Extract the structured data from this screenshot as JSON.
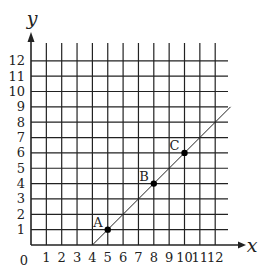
{
  "figure": {
    "origin_label": "0",
    "x_axis_label": "x",
    "y_axis_label": "y",
    "x_ticks": [
      "1",
      "2",
      "3",
      "4",
      "5",
      "6",
      "7",
      "8",
      "9",
      "10",
      "11",
      "12"
    ],
    "y_ticks": [
      "1",
      "2",
      "3",
      "4",
      "5",
      "6",
      "7",
      "8",
      "9",
      "10",
      "11",
      "12"
    ],
    "points": [
      {
        "label": "A",
        "x": 5,
        "y": 1
      },
      {
        "label": "B",
        "x": 8,
        "y": 4
      },
      {
        "label": "C",
        "x": 10,
        "y": 6
      }
    ],
    "line": {
      "from": [
        4,
        0
      ],
      "to": [
        13,
        9
      ],
      "equation": "y = x - 4"
    },
    "colors": {
      "grid": "#222222",
      "line": "#222222",
      "point": "#000000"
    }
  }
}
